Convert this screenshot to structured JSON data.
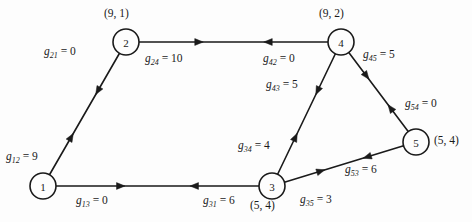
{
  "figure": {
    "type": "directed-graph",
    "background_color": "#fdfdfd",
    "stroke_color": "#1a1a1a"
  },
  "nodes": [
    {
      "id": "1",
      "label": "1",
      "cx": 43,
      "cy": 186,
      "r": 13,
      "coord": "",
      "coord_x": 0,
      "coord_y": 0
    },
    {
      "id": "2",
      "label": "2",
      "cx": 126,
      "cy": 42,
      "r": 13,
      "coord": "(9, 1)",
      "coord_x": 104,
      "coord_y": 7
    },
    {
      "id": "3",
      "label": "3",
      "cx": 272,
      "cy": 186,
      "r": 13,
      "coord": "(5, 4)",
      "coord_x": 250,
      "coord_y": 199
    },
    {
      "id": "4",
      "label": "4",
      "cx": 341,
      "cy": 42,
      "r": 13,
      "coord": "(9, 2)",
      "coord_x": 319,
      "coord_y": 7
    },
    {
      "id": "5",
      "label": "5",
      "cx": 416,
      "cy": 142,
      "r": 13,
      "coord": "(5, 4)",
      "coord_x": 434,
      "coord_y": 134
    }
  ],
  "edges": [
    {
      "from": "1",
      "to": "2",
      "name": "g12",
      "sub": "12",
      "weight": "9",
      "label_x": 6,
      "label_y": 150
    },
    {
      "from": "2",
      "to": "1",
      "name": "g21",
      "sub": "21",
      "weight": "0",
      "label_x": 44,
      "label_y": 45
    },
    {
      "from": "2",
      "to": "4",
      "name": "g24",
      "sub": "24",
      "weight": "10",
      "label_x": 145,
      "label_y": 52
    },
    {
      "from": "4",
      "to": "2",
      "name": "g42",
      "sub": "42",
      "weight": "0",
      "label_x": 263,
      "label_y": 52
    },
    {
      "from": "1",
      "to": "3",
      "name": "g13",
      "sub": "13",
      "weight": "0",
      "label_x": 76,
      "label_y": 194
    },
    {
      "from": "3",
      "to": "1",
      "name": "g31",
      "sub": "31",
      "weight": "6",
      "label_x": 203,
      "label_y": 194
    },
    {
      "from": "4",
      "to": "3",
      "name": "g43",
      "sub": "43",
      "weight": "5",
      "label_x": 266,
      "label_y": 78
    },
    {
      "from": "3",
      "to": "4",
      "name": "g34",
      "sub": "34",
      "weight": "4",
      "label_x": 238,
      "label_y": 139
    },
    {
      "from": "4",
      "to": "5",
      "name": "g45",
      "sub": "45",
      "weight": "5",
      "label_x": 363,
      "label_y": 48
    },
    {
      "from": "5",
      "to": "4",
      "name": "g54",
      "sub": "54",
      "weight": "0",
      "label_x": 405,
      "label_y": 97
    },
    {
      "from": "3",
      "to": "5",
      "name": "g35",
      "sub": "35",
      "weight": "3",
      "label_x": 300,
      "label_y": 193
    },
    {
      "from": "5",
      "to": "3",
      "name": "g53",
      "sub": "53",
      "weight": "6",
      "label_x": 345,
      "label_y": 163
    }
  ],
  "edge_geometry": [
    {
      "name": "edge-1-2",
      "x1": 43,
      "y1": 186,
      "x2": 126,
      "y2": 42,
      "fwd": true,
      "rev": true
    },
    {
      "name": "edge-2-4",
      "x1": 126,
      "y1": 42,
      "x2": 341,
      "y2": 42,
      "fwd": true,
      "rev": true
    },
    {
      "name": "edge-1-3",
      "x1": 43,
      "y1": 186,
      "x2": 272,
      "y2": 186,
      "fwd": true,
      "rev": true
    },
    {
      "name": "edge-3-4",
      "x1": 272,
      "y1": 186,
      "x2": 341,
      "y2": 42,
      "fwd": true,
      "rev": true
    },
    {
      "name": "edge-4-5",
      "x1": 341,
      "y1": 42,
      "x2": 416,
      "y2": 142,
      "fwd": true,
      "rev": true
    },
    {
      "name": "edge-3-5",
      "x1": 272,
      "y1": 186,
      "x2": 416,
      "y2": 142,
      "fwd": true,
      "rev": true
    }
  ]
}
